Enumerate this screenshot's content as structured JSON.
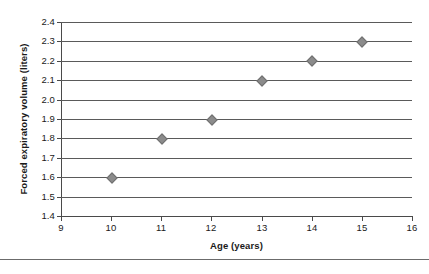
{
  "chart_data": {
    "type": "scatter",
    "title": "",
    "xlabel": "Age (years)",
    "ylabel": "Forced expiratory volume (liters)",
    "x": [
      10,
      11,
      12,
      13,
      14,
      15
    ],
    "values": [
      1.6,
      1.8,
      1.9,
      2.1,
      2.2,
      2.3
    ],
    "series": [
      {
        "name": "",
        "points": [
          {
            "x": 10,
            "y": 1.6
          },
          {
            "x": 11,
            "y": 1.8
          },
          {
            "x": 12,
            "y": 1.9
          },
          {
            "x": 13,
            "y": 2.1
          },
          {
            "x": 14,
            "y": 2.2
          },
          {
            "x": 15,
            "y": 2.3
          }
        ]
      }
    ],
    "xlim": [
      9,
      16
    ],
    "ylim": [
      1.4,
      2.4
    ],
    "xtick_labels": [
      "9",
      "10",
      "11",
      "12",
      "13",
      "14",
      "15",
      "16"
    ],
    "xticks": [
      9,
      10,
      11,
      12,
      13,
      14,
      15,
      16
    ],
    "ytick_labels": [
      "2.4",
      "2.3",
      "2.2",
      "2.1",
      "2.0",
      "1.9",
      "1.8",
      "1.7",
      "1.6",
      "1.5",
      "1.4"
    ],
    "yticks": [
      2.4,
      2.3,
      2.2,
      2.1,
      2.0,
      1.9,
      1.8,
      1.7,
      1.6,
      1.5,
      1.4
    ],
    "xstep": 1,
    "ystep": 0.1,
    "grid": "horizontal",
    "legend": "none",
    "marker": "diamond",
    "marker_color": "#8c8c8c",
    "gridline_color": "#5a5a5a",
    "axis_color": "#4a4a4a",
    "background_color": "#ffffff"
  }
}
